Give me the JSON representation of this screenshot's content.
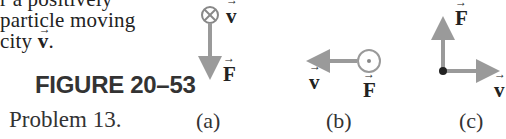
{
  "body_text": {
    "line1": "r a positively",
    "line2": "particle moving",
    "line3_prefix": "city ",
    "line3_vec": "v",
    "line3_suffix": "."
  },
  "figure": {
    "title": "FIGURE 20–53",
    "caption": "Problem 13.",
    "colors": {
      "arrow": "#9a9a9a",
      "text": "#222222"
    },
    "panels": [
      {
        "label": "(a)",
        "v_label": "v",
        "v_symbol": "into-page (⊗)",
        "F_label": "F",
        "F_direction": "down"
      },
      {
        "label": "(b)",
        "v_label": "v",
        "v_direction": "left",
        "F_label": "F",
        "F_symbol": "out-of-page (⊙)"
      },
      {
        "label": "(c)",
        "v_label": "v",
        "v_direction": "right",
        "F_label": "F",
        "F_direction": "up"
      }
    ]
  }
}
